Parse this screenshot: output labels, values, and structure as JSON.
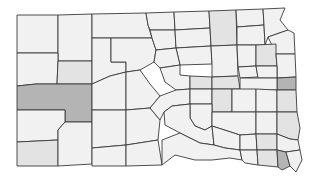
{
  "map": {
    "subject": "South Dakota counties",
    "colors": {
      "background": "#ffffff",
      "border": "#3a3a3a",
      "level0": "#f1f1f1",
      "level1": "#e3e3e3",
      "level2": "#d2d2d2",
      "level3": "#b4b4b4"
    },
    "counties": [
      {
        "d": "M17,15 L58,15 L58,53 L17,53 Z",
        "level": 0
      },
      {
        "d": "M58,15 L92,14 L92,61 L58,61 Z",
        "level": 0
      },
      {
        "d": "M92,14 L146,13 L148,25 L152,38 L92,38 Z",
        "level": 0
      },
      {
        "d": "M17,53 L58,53 L58,61 L57,84 L36,84 L17,86 Z",
        "level": 0
      },
      {
        "d": "M58,61 L92,61 L92,84 L57,84 Z",
        "level": 1
      },
      {
        "d": "M92,38 L111,38 L111,62 L126,62 L126,72 L110,76 L92,84 Z",
        "level": 0
      },
      {
        "d": "M111,38 L152,38 L156,50 L154,62 L140,70 L126,72 L126,62 L111,62 Z",
        "level": 0
      },
      {
        "d": "M146,13 L174,12 L175,30 L150,30 L148,25 Z",
        "level": 0
      },
      {
        "d": "M150,30 L175,30 L176,48 L156,50 L152,38 Z",
        "level": 0
      },
      {
        "d": "M174,12 L209,11 L210,28 L175,30 Z",
        "level": 0
      },
      {
        "d": "M175,30 L210,28 L211,46 L176,48 Z",
        "level": 0
      },
      {
        "d": "M209,11 L236,10 L237,45 L211,46 L210,28 Z",
        "level": 1
      },
      {
        "d": "M236,10 L263,9 L264,25 L237,27 Z",
        "level": 0
      },
      {
        "d": "M237,27 L264,25 L265,45 L237,45 Z",
        "level": 0
      },
      {
        "d": "M263,9 L285,8 L280,20 L288,30 L268,37 L265,45 L264,25 Z",
        "level": 0
      },
      {
        "d": "M268,37 L288,30 L294,33 L295,54 L276,54 Z",
        "level": 0
      },
      {
        "d": "M176,48 L211,46 L212,64 L180,65 Z",
        "level": 0
      },
      {
        "d": "M211,46 L237,45 L238,76 L212,77 L212,64 Z",
        "level": 0
      },
      {
        "d": "M237,45 L256,45 L256,66 L238,67 Z",
        "level": 0
      },
      {
        "d": "M256,45 L276,44 L276,54 L277,66 L256,66 Z",
        "level": 1
      },
      {
        "d": "M276,54 L295,54 L296,77 L277,78 L277,66 Z",
        "level": 0
      },
      {
        "d": "M156,50 L176,48 L180,65 L160,68 L154,62 Z",
        "level": 0
      },
      {
        "d": "M160,68 L180,65 L180,75 L190,76 L190,89 L176,90 L165,82 Z",
        "level": 0
      },
      {
        "d": "M190,76 L212,77 L212,89 L190,89 Z",
        "level": 1
      },
      {
        "d": "M212,77 L238,76 L240,89 L212,89 Z",
        "level": 1
      },
      {
        "d": "M238,67 L256,66 L258,77 L240,78 Z",
        "level": 0
      },
      {
        "d": "M256,66 L277,66 L277,78 L258,78 Z",
        "level": 0
      },
      {
        "d": "M277,78 L296,77 L296,90 L277,90 Z",
        "level": 3
      },
      {
        "d": "M240,78 L277,78 L277,90 L240,90 Z",
        "level": 0
      },
      {
        "d": "M17,86 L36,84 L57,84 L92,84 L92,122 L65,122 L65,110 L17,110 Z",
        "level": 3
      },
      {
        "d": "M92,84 L110,76 L126,72 L126,110 L92,110 Z",
        "level": 0
      },
      {
        "d": "M126,72 L140,70 L150,84 L160,96 L150,108 L126,110 Z",
        "level": 0
      },
      {
        "d": "M17,110 L65,110 L65,122 L58,130 L58,140 L17,142 Z",
        "level": 0
      },
      {
        "d": "M17,142 L58,140 L58,166 L17,166 Z",
        "level": 1
      },
      {
        "d": "M58,130 L65,122 L92,122 L92,164 L58,166 Z",
        "level": 0
      },
      {
        "d": "M92,110 L126,110 L126,145 L92,148 Z",
        "level": 0
      },
      {
        "d": "M92,148 L126,145 L126,166 L92,166 Z",
        "level": 0
      },
      {
        "d": "M126,110 L150,108 L160,120 L158,140 L126,145 Z",
        "level": 0
      },
      {
        "d": "M126,145 L158,140 L162,165 L126,166 Z",
        "level": 0
      },
      {
        "d": "M160,96 L176,90 L190,89 L190,104 L172,106 L164,112 L160,120 L150,108 Z",
        "level": 0
      },
      {
        "d": "M190,89 L212,89 L212,104 L190,104 Z",
        "level": 0
      },
      {
        "d": "M212,89 L232,89 L232,112 L212,112 L212,104 Z",
        "level": 1
      },
      {
        "d": "M232,89 L256,89 L256,112 L232,112 Z",
        "level": 0
      },
      {
        "d": "M256,89 L277,90 L277,112 L256,112 Z",
        "level": 0
      },
      {
        "d": "M277,90 L296,90 L297,112 L277,112 Z",
        "level": 1
      },
      {
        "d": "M190,104 L212,104 L212,126 L205,130 L195,126 L190,118 Z",
        "level": 0
      },
      {
        "d": "M212,112 L256,112 L256,134 L240,135 L212,126 Z",
        "level": 0
      },
      {
        "d": "M256,112 L277,112 L277,134 L256,134 Z",
        "level": 0
      },
      {
        "d": "M277,112 L297,112 L300,128 L298,140 L290,139 L277,134 Z",
        "level": 1
      },
      {
        "d": "M164,112 L172,106 L190,104 L190,118 L195,126 L205,130 L212,126 L214,145 L200,143 L180,133 L165,125 Z",
        "level": 0
      },
      {
        "d": "M212,126 L240,135 L240,150 L225,148 L214,145 Z",
        "level": 0
      },
      {
        "d": "M240,135 L256,134 L257,150 L240,150 Z",
        "level": 0
      },
      {
        "d": "M256,134 L277,134 L277,150 L257,150 Z",
        "level": 1
      },
      {
        "d": "M277,134 L290,139 L298,140 L300,150 L286,152 L277,150 Z",
        "level": 0
      },
      {
        "d": "M162,140 L180,133 L200,143 L214,145 L225,148 L240,150 L242,160 L230,158 L212,160 L195,160 L175,155 L162,165 Z",
        "level": 0
      },
      {
        "d": "M240,150 L257,150 L258,165 L245,163 L242,160 Z",
        "level": 0
      },
      {
        "d": "M257,150 L277,150 L278,167 L258,165 Z",
        "level": 1
      },
      {
        "d": "M277,150 L286,152 L290,166 L282,170 L278,167 Z",
        "level": 3
      },
      {
        "d": "M286,152 L300,150 L302,160 L296,172 L290,166 Z",
        "level": 0
      }
    ]
  }
}
